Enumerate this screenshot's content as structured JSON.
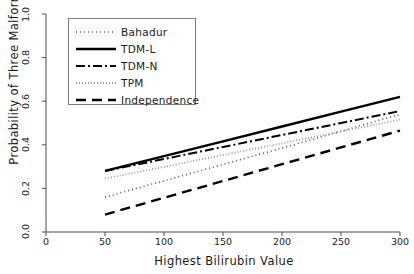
{
  "chart_data": {
    "type": "line",
    "title": "",
    "xlabel": "Highest Bilirubin Value",
    "ylabel": "Probability of Three Malformations",
    "xlim": [
      0,
      300
    ],
    "ylim": [
      0,
      1.0
    ],
    "xticks": [
      0,
      50,
      100,
      150,
      200,
      250,
      300
    ],
    "xtick_labels": [
      "0",
      "50",
      "100",
      "150",
      "200",
      "250",
      "300"
    ],
    "yticks": [
      0.0,
      0.2,
      0.4,
      0.6,
      0.8,
      1.0
    ],
    "ytick_labels": [
      "0.0",
      "0.2",
      "0.4",
      "0.6",
      "0.8",
      "1.0"
    ],
    "grid": false,
    "legend_position": "top-left",
    "x": [
      50,
      100,
      150,
      200,
      250,
      300
    ],
    "series": [
      {
        "name": "Bahadur",
        "style": "dotted",
        "color": "#555555",
        "width": 1.6,
        "dash": "1,3",
        "values": [
          0.16,
          0.235,
          0.31,
          0.385,
          0.462,
          0.54
        ]
      },
      {
        "name": "TDM-L",
        "style": "solid",
        "color": "#000000",
        "width": 2.4,
        "dash": "",
        "values": [
          0.28,
          0.348,
          0.416,
          0.484,
          0.552,
          0.62
        ]
      },
      {
        "name": "TDM-N",
        "style": "dashdot",
        "color": "#000000",
        "width": 2.0,
        "dash": "9,3,2,3",
        "values": [
          0.28,
          0.335,
          0.39,
          0.445,
          0.5,
          0.555
        ]
      },
      {
        "name": "TPM",
        "style": "fine-dotted",
        "color": "#9a9a9a",
        "width": 1.8,
        "dash": "1,2",
        "values": [
          0.245,
          0.299,
          0.353,
          0.407,
          0.461,
          0.515
        ]
      },
      {
        "name": "Independence",
        "style": "dashed",
        "color": "#000000",
        "width": 2.4,
        "dash": "10,6",
        "values": [
          0.08,
          0.157,
          0.234,
          0.311,
          0.388,
          0.465
        ]
      }
    ]
  },
  "legend": {
    "entries": [
      {
        "label": "Bahadur"
      },
      {
        "label": "TDM-L"
      },
      {
        "label": "TDM-N"
      },
      {
        "label": "TPM"
      },
      {
        "label": "Independence"
      }
    ]
  },
  "axes": {
    "axis_color": "#4d4d4d",
    "background": "#ffffff"
  }
}
